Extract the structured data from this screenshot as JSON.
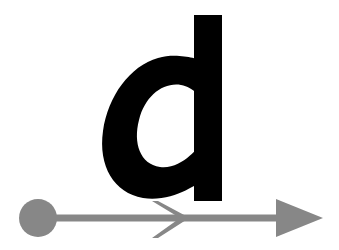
{
  "canvas": {
    "width": 339,
    "height": 250,
    "background_color": "#ffffff"
  },
  "glyph": {
    "character": "d",
    "case": "lowercase",
    "style": "bold italic sans-serif",
    "color": "#000000",
    "description": "Bold oblique lowercase letter d",
    "bowl": {
      "center_x": 155,
      "center_y": 128,
      "radius_x": 50,
      "radius_y": 68,
      "stroke_width": 30,
      "rotation_deg": 20,
      "counter_radius_x": 26,
      "counter_radius_y": 44
    },
    "stem": {
      "x": 194,
      "y": 15,
      "width": 28,
      "height": 186
    }
  },
  "arrow": {
    "color": "#878787",
    "description": "Horizontal gray arrow spanning the lower portion of the image",
    "shaft": {
      "x_start": 38,
      "x_end": 300,
      "y": 218,
      "thickness": 7
    },
    "tail_circle": {
      "center_x": 38,
      "center_y": 218,
      "radius": 19
    },
    "mid_chevron": {
      "apex_x": 183,
      "apex_y": 218,
      "back_x": 152,
      "top_y": 201,
      "bottom_y": 238,
      "thickness": 6
    },
    "head_triangle": {
      "tip_x": 323,
      "tip_y": 218,
      "back_x": 276,
      "top_y": 199,
      "bottom_y": 237
    }
  },
  "meta": {
    "alt_text": "Bold italic letter d above a gray arrow pointing right"
  }
}
